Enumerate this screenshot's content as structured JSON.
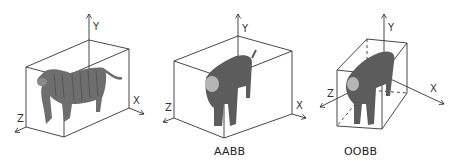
{
  "panels": [
    {
      "id": "original",
      "caption": "",
      "axes": {
        "x": "X",
        "y": "Y",
        "z": "Z"
      }
    },
    {
      "id": "aabb",
      "caption": "AABB",
      "axes": {
        "x": "X",
        "y": "Y",
        "z": "Z"
      }
    },
    {
      "id": "oobb",
      "caption": "OOBB",
      "axes": {
        "x": "X",
        "y": "Y",
        "z": "Z"
      }
    }
  ],
  "colors": {
    "line": "#333333",
    "tiger_body": "#6e6e6e",
    "tiger_dark": "#4a4a4a",
    "tiger_light": "#b5b5b5"
  }
}
